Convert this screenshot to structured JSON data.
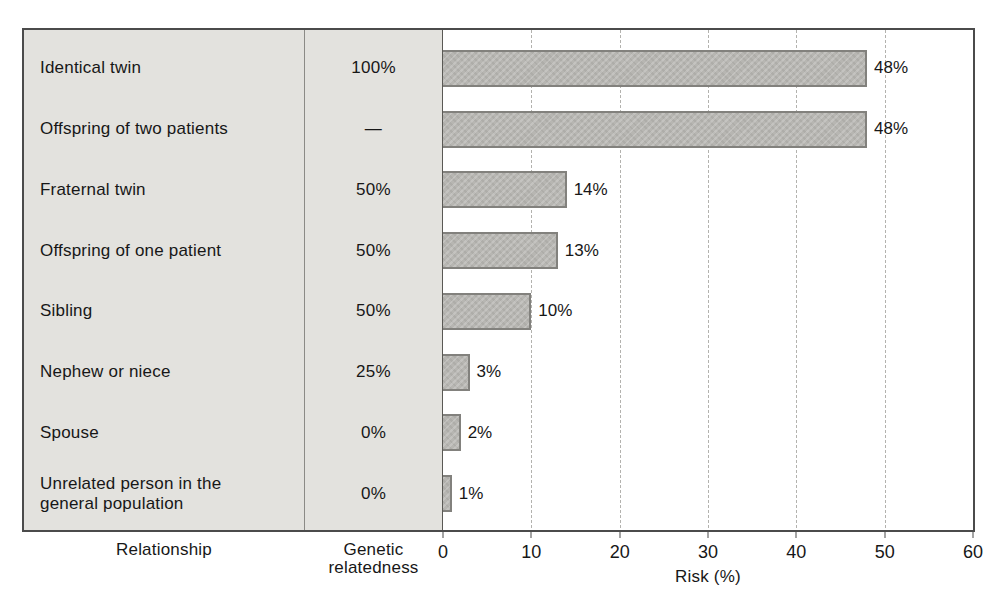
{
  "figure": {
    "colors": {
      "background": "#ffffff",
      "panel_bg": "#e3e2de",
      "bar_fill": "#b7b6b2",
      "bar_border": "#82817d",
      "box_border": "#4b4b4b",
      "gridline": "#b3b2ae",
      "text": "#171717"
    }
  },
  "axis": {
    "relationship_axis_label": "Relationship",
    "relatedness_axis_label_line1": "Genetic",
    "relatedness_axis_label_line2": "relatedness",
    "x_axis_title": "Risk (%)"
  },
  "chart_data": {
    "type": "bar",
    "orientation": "horizontal",
    "title": "",
    "xlabel": "Risk (%)",
    "ylabel": "Relationship",
    "xlim": [
      0,
      60
    ],
    "x_ticks": [
      0,
      10,
      20,
      30,
      40,
      50,
      60
    ],
    "grid": true,
    "legend": "none",
    "columns": {
      "relationship": "Relationship",
      "relatedness": "Genetic relatedness",
      "risk": "Risk (%)"
    },
    "rows": [
      {
        "relationship": "Identical twin",
        "relatedness": "100%",
        "risk": 48,
        "risk_label": "48%"
      },
      {
        "relationship": "Offspring of two patients",
        "relatedness": "—",
        "risk": 48,
        "risk_label": "48%"
      },
      {
        "relationship": "Fraternal twin",
        "relatedness": "50%",
        "risk": 14,
        "risk_label": "14%"
      },
      {
        "relationship": "Offspring of one patient",
        "relatedness": "50%",
        "risk": 13,
        "risk_label": "13%"
      },
      {
        "relationship": "Sibling",
        "relatedness": "50%",
        "risk": 10,
        "risk_label": "10%"
      },
      {
        "relationship": "Nephew or niece",
        "relatedness": "25%",
        "risk": 3,
        "risk_label": "3%"
      },
      {
        "relationship": "Spouse",
        "relatedness": "0%",
        "risk": 2,
        "risk_label": "2%"
      },
      {
        "relationship": "Unrelated person in the general population",
        "relatedness": "0%",
        "risk": 1,
        "risk_label": "1%"
      }
    ]
  }
}
